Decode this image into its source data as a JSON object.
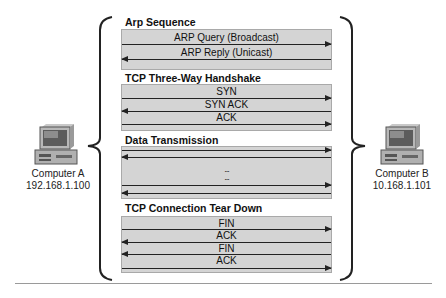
{
  "computer_a": {
    "name": "Computer A",
    "ip": "192.168.1.100",
    "icon": "desktop-computer-icon"
  },
  "computer_b": {
    "name": "Computer B",
    "ip": "10.168.1.101",
    "icon": "desktop-computer-icon"
  },
  "sections": [
    {
      "title": "Arp Sequence",
      "messages": [
        {
          "label": "ARP Query (Broadcast)",
          "direction": "right"
        },
        {
          "label": "ARP Reply (Unicast)",
          "direction": "left"
        }
      ]
    },
    {
      "title": "TCP Three-Way Handshake",
      "messages": [
        {
          "label": "SYN",
          "direction": "right"
        },
        {
          "label": "SYN ACK",
          "direction": "left"
        },
        {
          "label": "ACK",
          "direction": "right"
        }
      ]
    },
    {
      "title": "Data Transmission",
      "messages": [
        {
          "label": "",
          "direction": "right"
        },
        {
          "label": "",
          "direction": "left"
        },
        {
          "label": "...",
          "direction": "none"
        },
        {
          "label": "...",
          "direction": "none"
        },
        {
          "label": "",
          "direction": "right"
        },
        {
          "label": "",
          "direction": "left"
        }
      ]
    },
    {
      "title": "TCP Connection Tear Down",
      "messages": [
        {
          "label": "FIN",
          "direction": "right"
        },
        {
          "label": "ACK",
          "direction": "left"
        },
        {
          "label": "FIN",
          "direction": "left"
        },
        {
          "label": "ACK",
          "direction": "right"
        }
      ]
    }
  ],
  "colors": {
    "box_fill": "#d4d4d4",
    "box_border": "#a9a9a9",
    "arrow": "#222222",
    "brace": "#222222"
  }
}
